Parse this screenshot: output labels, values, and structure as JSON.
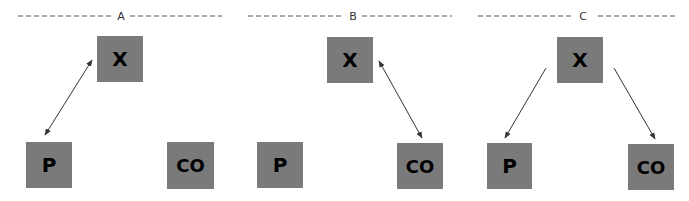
{
  "diagram": {
    "colors": {
      "node_fill": "#7a7a7a",
      "node_text": "#000000",
      "edge": "#333333",
      "divider": "#555555",
      "background": "#ffffff"
    },
    "panels": [
      {
        "label": "A",
        "nodes": [
          {
            "id": "X",
            "label": "X"
          },
          {
            "id": "P",
            "label": "P"
          },
          {
            "id": "CO",
            "label": "CO"
          }
        ],
        "edges": [
          {
            "from": "X",
            "to": "P",
            "direction": "bidirectional"
          }
        ]
      },
      {
        "label": "B",
        "nodes": [
          {
            "id": "X",
            "label": "X"
          },
          {
            "id": "P",
            "label": "P"
          },
          {
            "id": "CO",
            "label": "CO"
          }
        ],
        "edges": [
          {
            "from": "X",
            "to": "CO",
            "direction": "bidirectional"
          }
        ]
      },
      {
        "label": "C",
        "nodes": [
          {
            "id": "X",
            "label": "X"
          },
          {
            "id": "P",
            "label": "P"
          },
          {
            "id": "CO",
            "label": "CO"
          }
        ],
        "edges": [
          {
            "from": "X",
            "to": "P",
            "direction": "forward"
          },
          {
            "from": "X",
            "to": "CO",
            "direction": "forward"
          }
        ]
      }
    ]
  }
}
